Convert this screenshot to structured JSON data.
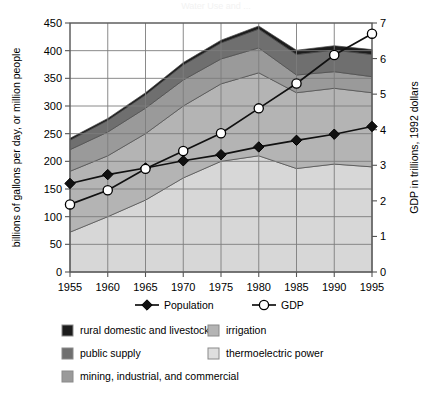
{
  "figure": {
    "ghost_title": "Water Use and ...",
    "background": "#ffffff"
  },
  "chart_data": {
    "type": "area",
    "title": "",
    "subtitle": "",
    "xlabel": "",
    "ylabel": "billions of gallons per day, or million people",
    "y2label": "GDP in trillions, 1992 dollars",
    "x": [
      1955,
      1960,
      1965,
      1970,
      1975,
      1980,
      1985,
      1990,
      1995
    ],
    "xticklabels": [
      "1955",
      "1960",
      "1965",
      "1970",
      "1975",
      "1980",
      "1985",
      "1990",
      "1995"
    ],
    "xlim": [
      1955,
      1995
    ],
    "ylim": [
      0,
      450
    ],
    "yticks": [
      0,
      50,
      100,
      150,
      200,
      250,
      300,
      350,
      400,
      450
    ],
    "yticklabels": [
      "0",
      "50",
      "100",
      "150",
      "200",
      "250",
      "300",
      "350",
      "400",
      "450"
    ],
    "y2lim": [
      0,
      7
    ],
    "y2ticks": [
      0,
      1,
      2,
      3,
      4,
      5,
      6,
      7
    ],
    "y2ticklabels": [
      "0",
      "1",
      "2",
      "3",
      "4",
      "5",
      "6",
      "7"
    ],
    "grid": true,
    "legend_position": "bottom",
    "stack_order_bottom_to_top": [
      "thermoelectric power",
      "irrigation",
      "mining, industrial, and commercial",
      "public supply",
      "rural domestic and livestock"
    ],
    "series": [
      {
        "name": "thermoelectric power",
        "kind": "area",
        "color": "#d7d7d7",
        "axis": "left",
        "values": [
          72,
          100,
          130,
          170,
          200,
          210,
          187,
          195,
          190
        ]
      },
      {
        "name": "irrigation",
        "kind": "area",
        "color": "#b4b4b4",
        "axis": "left",
        "values": [
          110,
          110,
          120,
          130,
          140,
          150,
          137,
          137,
          134
        ]
      },
      {
        "name": "mining, industrial, and commercial",
        "kind": "area",
        "color": "#9a9a9a",
        "axis": "left",
        "values": [
          39,
          43,
          46,
          47,
          45,
          45,
          32,
          30,
          29
        ]
      },
      {
        "name": "public supply",
        "kind": "area",
        "color": "#6f6f6f",
        "axis": "left",
        "values": [
          17,
          21,
          24,
          27,
          29,
          34,
          37,
          39,
          40
        ]
      },
      {
        "name": "rural domestic and livestock",
        "kind": "area",
        "color": "#1c1c1c",
        "axis": "left",
        "values": [
          3.6,
          3.6,
          4.0,
          4.5,
          4.9,
          5.6,
          7.8,
          7.9,
          8.9
        ]
      },
      {
        "name": "Population",
        "kind": "line",
        "marker": "diamond",
        "color": "#111111",
        "marker_fill": "#111111",
        "axis": "left",
        "unit": "million people",
        "values": [
          160,
          176,
          188,
          201,
          212,
          226,
          238,
          249,
          263
        ]
      },
      {
        "name": "GDP",
        "kind": "line",
        "marker": "circle",
        "color": "#111111",
        "marker_fill": "#ffffff",
        "axis": "right",
        "unit": "trillions of 1992 dollars",
        "values": [
          1.9,
          2.3,
          2.9,
          3.4,
          3.9,
          4.6,
          5.3,
          6.1,
          6.7
        ]
      }
    ],
    "legend": {
      "line_entries": [
        {
          "label": "Population",
          "marker": "diamond",
          "fill": "#111111"
        },
        {
          "label": "GDP",
          "marker": "circle",
          "fill": "#ffffff"
        }
      ],
      "area_entries_left": [
        {
          "label": "rural domestic and livestock",
          "color": "#1c1c1c"
        },
        {
          "label": "public supply",
          "color": "#6f6f6f"
        },
        {
          "label": "mining, industrial, and commercial",
          "color": "#9a9a9a"
        }
      ],
      "area_entries_right": [
        {
          "label": "irrigation",
          "color": "#b4b4b4"
        },
        {
          "label": "thermoelectric power",
          "color": "#dedede"
        }
      ]
    }
  }
}
